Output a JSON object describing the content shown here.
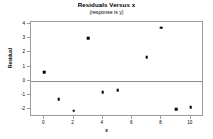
{
  "chart_data": {
    "type": "scatter",
    "title": "Residuals Versus x",
    "subtitle": "(response is y)",
    "xlabel": "x",
    "ylabel": "Residual",
    "xlim": [
      -0.9,
      10.9
    ],
    "ylim": [
      -2.55,
      4.15
    ],
    "grid": false,
    "legend": null,
    "reference_line": {
      "orientation": "horizontal",
      "value": 0
    },
    "xticks": [
      0,
      2,
      4,
      6,
      8,
      10
    ],
    "xtick_labels": [
      "0",
      "2",
      "4",
      "6",
      "8",
      "10"
    ],
    "yticks": [
      4,
      3,
      2,
      1,
      0,
      -1,
      -2
    ],
    "ytick_labels": [
      "4",
      "3",
      "2",
      "1",
      "0",
      "-1",
      "-2"
    ],
    "marker": {
      "shape": "square",
      "color": "#000000",
      "size": 2.6
    },
    "series": [
      {
        "name": "Residual",
        "x": [
          0,
          1,
          2,
          3,
          4,
          5,
          7,
          8,
          9,
          10
        ],
        "y": [
          0.6,
          -1.3,
          -2.1,
          3.0,
          -0.8,
          -0.65,
          1.65,
          3.75,
          -2.0,
          -1.85
        ]
      }
    ],
    "points": [
      {
        "x": 0,
        "y": 0.6
      },
      {
        "x": 1,
        "y": -1.3
      },
      {
        "x": 2,
        "y": -2.1
      },
      {
        "x": 3,
        "y": 3.0
      },
      {
        "x": 4,
        "y": -0.8
      },
      {
        "x": 5,
        "y": -0.65
      },
      {
        "x": 7,
        "y": 1.65
      },
      {
        "x": 8,
        "y": 3.75
      },
      {
        "x": 9,
        "y": -2.0
      },
      {
        "x": 10,
        "y": -1.85
      }
    ],
    "colors": {
      "background": "#ffffff",
      "frame": "#9b9b9b",
      "reference_line": "#8c8c8c",
      "marker": "#000000",
      "text": "#000000"
    }
  }
}
